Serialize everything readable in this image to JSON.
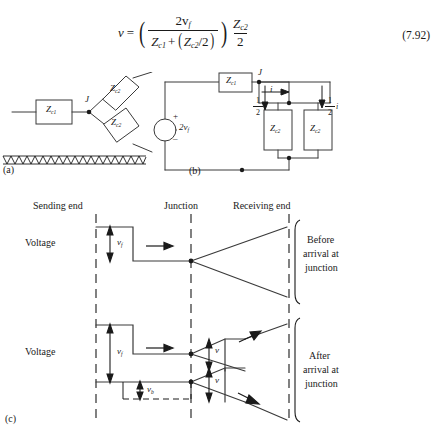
{
  "equation": {
    "lhs": "v",
    "equals": "=",
    "numer_top": "2v",
    "numer_top_sub": "f",
    "denom_z1": "Z",
    "denom_z1_sub": "c1",
    "denom_plus": "+",
    "denom_z2": "Z",
    "denom_z2_sub": "c2",
    "denom_half": "/2",
    "right_num": "Z",
    "right_num_sub": "c2",
    "right_den": "2",
    "number": "(7.92)"
  },
  "figure_a": {
    "tag": "(a)",
    "box_line": {
      "z": "Z",
      "sub": "c1"
    },
    "junction_label": "J",
    "branch_upper": {
      "z": "Z",
      "sub": "c2"
    },
    "branch_lower": {
      "z": "Z",
      "sub": "c2"
    }
  },
  "figure_b": {
    "tag": "(b)",
    "source_label": "2v",
    "source_sub": "f",
    "source_plus": "+",
    "source_minus": "–",
    "series_box": {
      "z": "Z",
      "sub": "c1"
    },
    "junction_label": "J",
    "current_label": "i",
    "half_current_left": {
      "num": "1",
      "den": "2",
      "sym": "i"
    },
    "half_current_right": {
      "num": "1",
      "den": "2",
      "sym": "i"
    },
    "shunt_box_left": {
      "z": "Z",
      "sub": "c2"
    },
    "shunt_box_right": {
      "z": "Z",
      "sub": "c2"
    }
  },
  "figure_c": {
    "tag": "(c)",
    "col_labels": {
      "sending": "Sending end",
      "junction": "Junction",
      "receiving": "Receiving end"
    },
    "axis_label_top": "Voltage",
    "axis_label_bottom": "Voltage",
    "top_wave_label": {
      "sym": "v",
      "sub": "f"
    },
    "top_state": [
      "Before",
      "arrival at",
      "junction"
    ],
    "bottom_wave_forward": {
      "sym": "v",
      "sub": "f"
    },
    "bottom_wave_back": {
      "sym": "v",
      "sub": "b"
    },
    "bottom_junction_upper": {
      "sym": "v",
      "sub": ""
    },
    "bottom_junction_lower": {
      "sym": "v",
      "sub": ""
    },
    "bottom_state": [
      "After",
      "arrival at",
      "junction"
    ]
  },
  "colors": {
    "ink": "#1a1a1a",
    "line": "#3a3a3a",
    "paper": "#ffffff"
  }
}
